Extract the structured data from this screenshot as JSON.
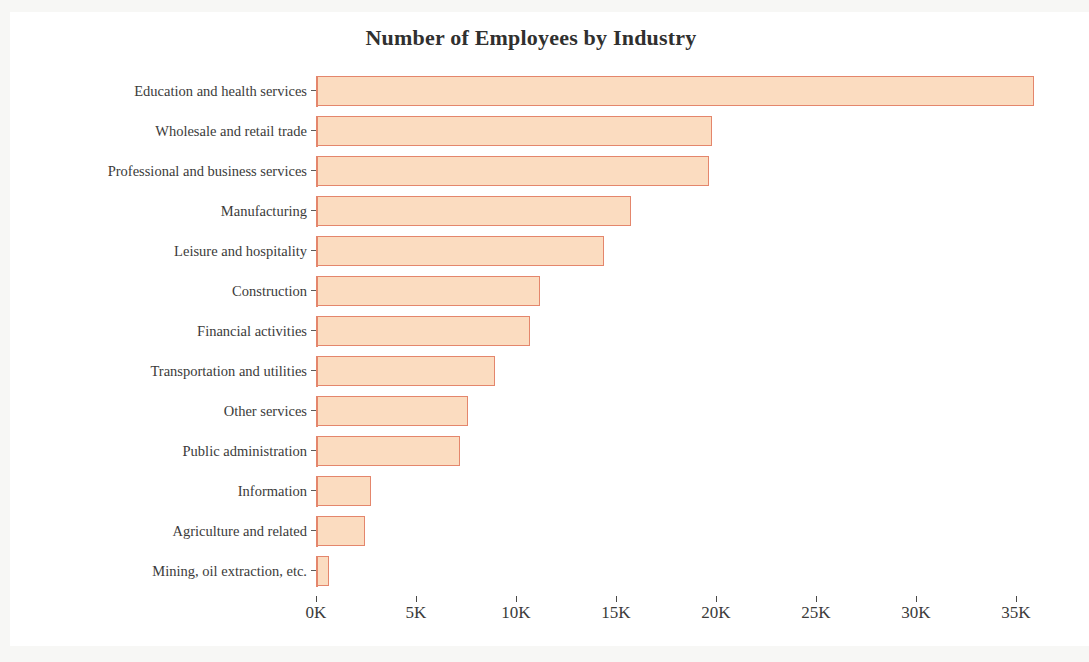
{
  "chart_data": {
    "type": "bar",
    "orientation": "horizontal",
    "title": "Number of Employees by Industry",
    "xlabel": "",
    "ylabel": "",
    "xlim": [
      0,
      36500
    ],
    "xticks": [
      0,
      5000,
      10000,
      15000,
      20000,
      25000,
      30000,
      35000
    ],
    "xtick_labels": [
      "0K",
      "5K",
      "10K",
      "15K",
      "20K",
      "25K",
      "30K",
      "35K"
    ],
    "grid": false,
    "legend": null,
    "bar_fill_color": "#fbdcc0",
    "bar_edge_color": "#e4866c",
    "background_color": "#ffffff",
    "text_color": "#3b3b3a",
    "categories": [
      "Education and health services",
      "Wholesale and retail trade",
      "Professional and business services",
      "Manufacturing",
      "Leisure and hospitality",
      "Construction",
      "Financial activities",
      "Transportation and utilities",
      "Other services",
      "Public administration",
      "Information",
      "Agriculture and related",
      "Mining, oil extraction, etc."
    ],
    "values": [
      35900,
      19800,
      19650,
      15750,
      14400,
      11200,
      10700,
      8950,
      7600,
      7200,
      2750,
      2450,
      650
    ]
  }
}
